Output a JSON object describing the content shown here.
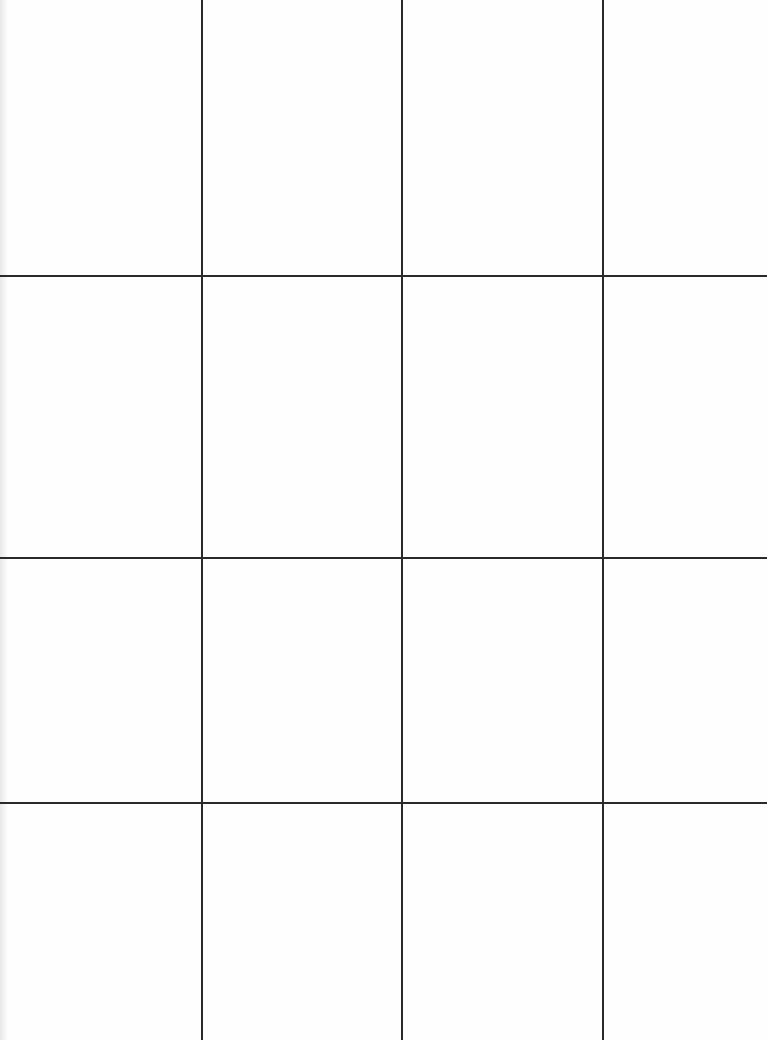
{
  "grid": {
    "columns": 4,
    "rows": 4,
    "vertical_lines_x": [
      201,
      401,
      602
    ],
    "horizontal_lines_y": [
      275,
      557,
      802
    ],
    "line_color": "#2a2a2a",
    "background": "#fefefe"
  }
}
